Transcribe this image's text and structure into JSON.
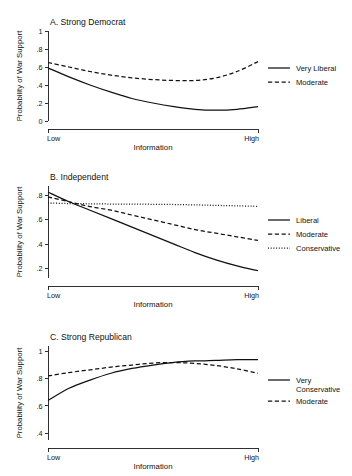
{
  "figure": {
    "background": "#ffffff",
    "ink": "#111111"
  },
  "chart_data": [
    {
      "type": "line",
      "panel_id": "A",
      "title": "A. Strong Democrat",
      "xlabel": "Information",
      "ylabel": "Probability of War Support",
      "xticklabels": [
        "Low",
        "High"
      ],
      "xlim": [
        0,
        1
      ],
      "ylim": [
        0,
        1
      ],
      "yticks": [
        0,
        0.2,
        0.4,
        0.6,
        0.8,
        1
      ],
      "yticklabels": [
        "0",
        ".2",
        ".4",
        ".6",
        ".8",
        "1"
      ],
      "grid": false,
      "legend_position": "right",
      "x": [
        0,
        0.1,
        0.2,
        0.3,
        0.4,
        0.5,
        0.6,
        0.7,
        0.8,
        0.9,
        1
      ],
      "series": [
        {
          "name": "Very Liberal",
          "style": "solid",
          "values": [
            0.59,
            0.49,
            0.4,
            0.32,
            0.25,
            0.2,
            0.16,
            0.13,
            0.12,
            0.13,
            0.16
          ]
        },
        {
          "name": "Moderate",
          "style": "dashed",
          "values": [
            0.65,
            0.6,
            0.55,
            0.51,
            0.48,
            0.46,
            0.45,
            0.45,
            0.48,
            0.55,
            0.66
          ]
        }
      ]
    },
    {
      "type": "line",
      "panel_id": "B",
      "title": "B. Independent",
      "xlabel": "Information",
      "ylabel": "Probability of War Support",
      "xticklabels": [
        "Low",
        "High"
      ],
      "xlim": [
        0,
        1
      ],
      "ylim": [
        0.12,
        0.88
      ],
      "yticks": [
        0.2,
        0.4,
        0.6,
        0.8
      ],
      "yticklabels": [
        ".2",
        ".4",
        ".6",
        ".8"
      ],
      "grid": false,
      "legend_position": "right",
      "x": [
        0,
        0.1,
        0.2,
        0.3,
        0.4,
        0.5,
        0.6,
        0.7,
        0.8,
        0.9,
        1
      ],
      "series": [
        {
          "name": "Liberal",
          "style": "solid",
          "values": [
            0.83,
            0.75,
            0.68,
            0.61,
            0.54,
            0.47,
            0.4,
            0.33,
            0.27,
            0.22,
            0.18
          ]
        },
        {
          "name": "Moderate",
          "style": "dashed",
          "values": [
            0.79,
            0.75,
            0.71,
            0.68,
            0.64,
            0.6,
            0.56,
            0.52,
            0.49,
            0.46,
            0.43
          ]
        },
        {
          "name": "Conservative",
          "style": "dotted",
          "values": [
            0.74,
            0.735,
            0.733,
            0.731,
            0.73,
            0.729,
            0.727,
            0.724,
            0.72,
            0.716,
            0.712
          ]
        }
      ]
    },
    {
      "type": "line",
      "panel_id": "C",
      "title": "C. Strong Republican",
      "xlabel": "Information",
      "ylabel": "Probability of War Support",
      "xticklabels": [
        "Low",
        "High"
      ],
      "xlim": [
        0,
        1
      ],
      "ylim": [
        0.35,
        1.04
      ],
      "yticks": [
        0.4,
        0.6,
        0.8,
        1
      ],
      "yticklabels": [
        ".4",
        ".6",
        ".8",
        "1"
      ],
      "grid": false,
      "legend_position": "right",
      "x": [
        0,
        0.1,
        0.2,
        0.3,
        0.4,
        0.5,
        0.6,
        0.7,
        0.8,
        0.9,
        1
      ],
      "series": [
        {
          "name": "Very Conservative",
          "style": "solid",
          "values": [
            0.64,
            0.73,
            0.79,
            0.84,
            0.875,
            0.9,
            0.92,
            0.93,
            0.935,
            0.94,
            0.94
          ]
        },
        {
          "name": "Moderate",
          "style": "dashed",
          "values": [
            0.82,
            0.845,
            0.865,
            0.885,
            0.9,
            0.915,
            0.918,
            0.912,
            0.897,
            0.872,
            0.84
          ]
        }
      ]
    }
  ]
}
